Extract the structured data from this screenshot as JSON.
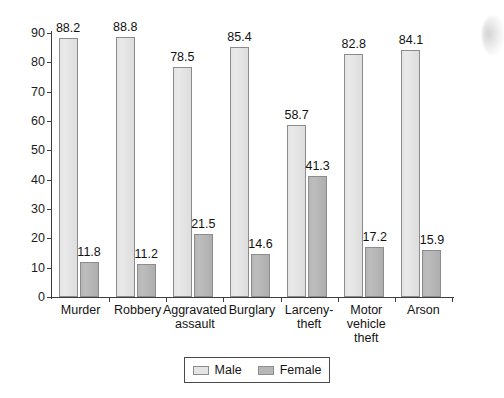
{
  "chart_data": {
    "type": "bar",
    "title": "",
    "subtitle": "",
    "xlabel": "",
    "ylabel": "",
    "ylim": [
      0,
      90
    ],
    "yticks": [
      0,
      10,
      20,
      30,
      40,
      50,
      60,
      70,
      80,
      90
    ],
    "grid": false,
    "legend_position": "bottom-center",
    "categories": [
      "Murder",
      "Robbery",
      "Aggravated\nassault",
      "Burglary",
      "Larceny-\ntheft",
      "Motor\nvehicle\ntheft",
      "Arson"
    ],
    "series": [
      {
        "name": "Male",
        "color": "#e4e4e4",
        "values": [
          88.2,
          88.8,
          78.5,
          85.4,
          58.7,
          82.8,
          84.1
        ],
        "labels": [
          "88.2",
          "88.8",
          "78.5",
          "85.4",
          "58.7",
          "82.8",
          "84.1"
        ]
      },
      {
        "name": "Female",
        "color": "#b6b6b6",
        "values": [
          11.8,
          11.2,
          21.5,
          14.6,
          41.3,
          17.2,
          15.9
        ],
        "labels": [
          "11.8",
          "11.2",
          "21.5",
          "14.6",
          "41.3",
          "17.2",
          "15.9"
        ]
      }
    ]
  },
  "legend": {
    "items": [
      {
        "label": "Male",
        "swatch": "male-swatch"
      },
      {
        "label": "Female",
        "swatch": "female-swatch"
      }
    ]
  },
  "artifact": {
    "name": "scan-shadow"
  }
}
